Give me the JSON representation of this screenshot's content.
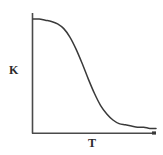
{
  "figure": {
    "background_color": "#ffffff",
    "line_color": "#3a3a3a",
    "axis_color": "#4a4a4a",
    "label_color": "#2b2b2b"
  },
  "labels": {
    "ylabel": "K",
    "xlabel": "T"
  },
  "chart_data": {
    "type": "line",
    "title": "",
    "subtitle": "",
    "xlabel": "T",
    "ylabel": "K",
    "xlim": [
      0,
      1
    ],
    "ylim": [
      0,
      1
    ],
    "grid": false,
    "legend": null,
    "axis_style": "two-spine L-shape, arrowless, no tick marks, no tick labels",
    "annotations": [],
    "series": [
      {
        "name": "K(T)",
        "x": [
          0.0,
          0.05,
          0.1,
          0.15,
          0.2,
          0.25,
          0.3,
          0.35,
          0.4,
          0.45,
          0.5,
          0.55,
          0.6,
          0.65,
          0.7,
          0.75,
          0.8,
          0.85,
          0.9,
          0.95,
          1.0
        ],
        "y": [
          0.95,
          0.95,
          0.94,
          0.93,
          0.91,
          0.87,
          0.8,
          0.7,
          0.58,
          0.45,
          0.33,
          0.23,
          0.16,
          0.11,
          0.08,
          0.07,
          0.06,
          0.05,
          0.05,
          0.04,
          0.04
        ]
      }
    ]
  }
}
